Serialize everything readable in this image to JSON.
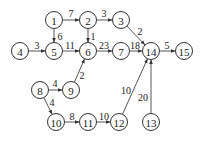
{
  "nodes": [
    {
      "id": "1",
      "label": "1",
      "x": 54,
      "y": 20
    },
    {
      "id": "2",
      "label": "2",
      "x": 88,
      "y": 20
    },
    {
      "id": "3",
      "label": "3",
      "x": 121,
      "y": 20
    },
    {
      "id": "4",
      "label": "4",
      "x": 20,
      "y": 51
    },
    {
      "id": "5",
      "label": "5",
      "x": 54,
      "y": 51
    },
    {
      "id": "6",
      "label": "6",
      "x": 88,
      "y": 51
    },
    {
      "id": "7",
      "label": "7",
      "x": 121,
      "y": 51
    },
    {
      "id": "14",
      "label": "14",
      "x": 151,
      "y": 51
    },
    {
      "id": "15",
      "label": "15",
      "x": 184,
      "y": 51
    },
    {
      "id": "8",
      "label": "8",
      "x": 40,
      "y": 90
    },
    {
      "id": "9",
      "label": "9",
      "x": 71,
      "y": 90
    },
    {
      "id": "10",
      "label": "10",
      "x": 56,
      "y": 122
    },
    {
      "id": "11",
      "label": "11",
      "x": 88,
      "y": 122
    },
    {
      "id": "12",
      "label": "12",
      "x": 119,
      "y": 122
    },
    {
      "id": "13",
      "label": "13",
      "x": 151,
      "y": 122
    }
  ],
  "edges": [
    {
      "from": "1",
      "to": "2",
      "weight": "7",
      "lx": 71,
      "ly": 13
    },
    {
      "from": "2",
      "to": "3",
      "weight": "3",
      "lx": 104,
      "ly": 13
    },
    {
      "from": "1",
      "to": "5",
      "weight": "6",
      "lx": 60,
      "ly": 36
    },
    {
      "from": "2",
      "to": "6",
      "weight": "1",
      "lx": 93,
      "ly": 36
    },
    {
      "from": "3",
      "to": "14",
      "weight": "2",
      "lx": 140,
      "ly": 31
    },
    {
      "from": "4",
      "to": "5",
      "weight": "3",
      "lx": 37,
      "ly": 45
    },
    {
      "from": "5",
      "to": "6",
      "weight": "11",
      "lx": 70,
      "ly": 45
    },
    {
      "from": "6",
      "to": "7",
      "weight": "23",
      "lx": 104,
      "ly": 45
    },
    {
      "from": "7",
      "to": "14",
      "weight": "18",
      "lx": 135,
      "ly": 45
    },
    {
      "from": "14",
      "to": "15",
      "weight": "5",
      "lx": 167,
      "ly": 45
    },
    {
      "from": "9",
      "to": "6",
      "weight": "2",
      "lx": 82,
      "ly": 75
    },
    {
      "from": "8",
      "to": "9",
      "weight": "4",
      "lx": 55,
      "ly": 83
    },
    {
      "from": "8",
      "to": "10",
      "weight": "4",
      "lx": 52,
      "ly": 102
    },
    {
      "from": "10",
      "to": "11",
      "weight": "8",
      "lx": 72,
      "ly": 116
    },
    {
      "from": "11",
      "to": "12",
      "weight": "10",
      "lx": 104,
      "ly": 116
    },
    {
      "from": "12",
      "to": "14",
      "weight": "10",
      "lx": 126,
      "ly": 90
    },
    {
      "from": "13",
      "to": "14",
      "weight": "20",
      "lx": 143,
      "ly": 97
    }
  ]
}
